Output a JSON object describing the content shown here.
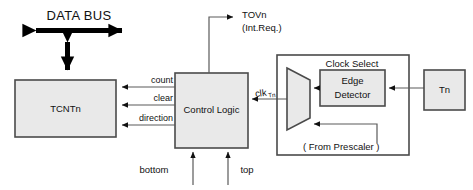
{
  "diagram": {
    "background_color": "#ffffff",
    "block_fill_color": "#e9e9e9",
    "block_stroke_color": "#4a4a4a",
    "wire_color": "#5a5a5a",
    "bus_color": "#000000"
  },
  "bus": {
    "label": "DATA BUS"
  },
  "blocks": {
    "tcntn": {
      "label": "TCNTn"
    },
    "control_logic": {
      "label": "Control  Logic"
    },
    "clock_select": {
      "label": "Clock Select"
    },
    "edge_detector": {
      "line1": "Edge",
      "line2": "Detector"
    },
    "tn": {
      "label": "Tn"
    },
    "mux": {
      "label": ""
    }
  },
  "signals": {
    "count": "count",
    "clear": "clear",
    "direction": "direction",
    "bottom": "bottom",
    "top": "top",
    "clk_main": "clk",
    "clk_sub": "Tn",
    "tovn": "TOVn",
    "tovn_note": "(Int.Req.)",
    "prescaler": "( From Prescaler )"
  }
}
